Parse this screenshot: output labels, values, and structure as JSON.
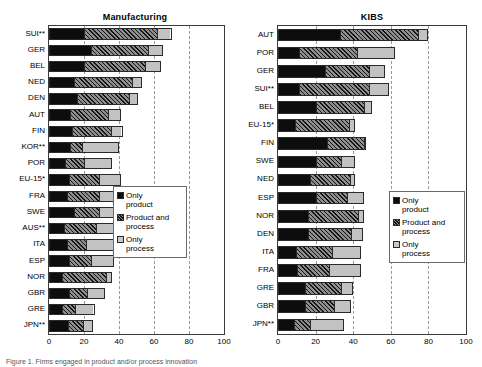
{
  "figure": {
    "caption_fragment": "Figure 1. Firms engaged in product and/or process innovation"
  },
  "legend": {
    "items": [
      {
        "name": "only-product",
        "label": "Only\nproduct"
      },
      {
        "name": "product-and-process",
        "label": "Product and\nprocess"
      },
      {
        "name": "only-process",
        "label": "Only\nprocess"
      }
    ]
  },
  "colors": {
    "only_product": "#0d0d0d",
    "product_and_process": "#8e8e8e",
    "only_process": "#c2c2c2",
    "grid": "#9a9a9a",
    "frame": "#3a3a3a"
  },
  "chart_data": [
    {
      "type": "bar",
      "orientation": "horizontal",
      "stacked": true,
      "title": "Manufacturing",
      "xlabel": "",
      "ylabel": "",
      "xlim": [
        0,
        100
      ],
      "xticks": [
        0,
        20,
        40,
        60,
        80,
        100
      ],
      "grid": true,
      "legend_position": "inside-right",
      "categories": [
        "SUI**",
        "GER",
        "BEL",
        "NED",
        "DEN",
        "AUT",
        "FIN",
        "KOR**",
        "POR",
        "EU-15*",
        "FRA",
        "SWE",
        "AUS**",
        "ITA",
        "ESP",
        "NOR",
        "GBR",
        "GRE",
        "JPN**"
      ],
      "series": [
        {
          "name": "Only product",
          "values": [
            20,
            24,
            20,
            14,
            16,
            12,
            13,
            12,
            9,
            11,
            10,
            14,
            8,
            10,
            11,
            7,
            11,
            7,
            11
          ]
        },
        {
          "name": "Product and process",
          "values": [
            42,
            33,
            35,
            34,
            30,
            22,
            23,
            7,
            11,
            18,
            19,
            15,
            19,
            11,
            13,
            26,
            11,
            8,
            9
          ]
        },
        {
          "name": "Only process",
          "values": [
            8,
            8,
            9,
            5,
            5,
            7,
            6,
            21,
            16,
            12,
            12,
            9,
            13,
            17,
            13,
            3,
            10,
            11,
            5
          ]
        }
      ],
      "totals": [
        70,
        65,
        64,
        53,
        51,
        41,
        42,
        40,
        36,
        41,
        41,
        38,
        40,
        38,
        37,
        36,
        32,
        26,
        25
      ]
    },
    {
      "type": "bar",
      "orientation": "horizontal",
      "stacked": true,
      "title": "KIBS",
      "xlabel": "",
      "ylabel": "",
      "xlim": [
        0,
        100
      ],
      "xticks": [
        0,
        20,
        40,
        60,
        80,
        100
      ],
      "grid": true,
      "legend_position": "inside-right",
      "categories": [
        "AUT",
        "POR",
        "GER",
        "SUI**",
        "BEL",
        "EU-15*",
        "FIN",
        "SWE",
        "NED",
        "ESP",
        "NOR",
        "DEN",
        "ITA",
        "FRA",
        "GRE",
        "GBR",
        "JPN**"
      ],
      "series": [
        {
          "name": "Only product",
          "values": [
            33,
            11,
            25,
            11,
            20,
            9,
            26,
            20,
            17,
            20,
            16,
            16,
            9,
            10,
            14,
            14,
            8
          ]
        },
        {
          "name": "Product and process",
          "values": [
            42,
            31,
            24,
            38,
            26,
            29,
            20,
            14,
            22,
            17,
            27,
            23,
            20,
            17,
            20,
            16,
            9
          ]
        },
        {
          "name": "Only process",
          "values": [
            5,
            20,
            8,
            10,
            4,
            3,
            1,
            7,
            2,
            9,
            3,
            6,
            15,
            17,
            6,
            9,
            18
          ]
        }
      ],
      "totals": [
        80,
        62,
        57,
        59,
        50,
        41,
        47,
        41,
        41,
        46,
        46,
        45,
        44,
        44,
        40,
        39,
        35
      ]
    }
  ]
}
